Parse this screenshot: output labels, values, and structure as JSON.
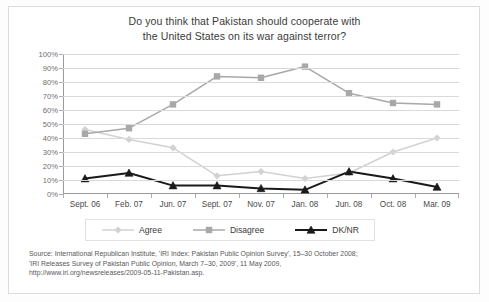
{
  "title": {
    "line1": "Do you think that Pakistan should cooperate with",
    "line2": "the United States on its war against terror?"
  },
  "source": {
    "line1": "Source: International Republican Institute, 'IRI Index: Pakistan Public Opinion Survey', 15–30 October 2008;",
    "line2": "'IRI Releases Survey of Pakistan Public Opinion, March 7–30, 2009', 11 May 2009,",
    "line3": "http://www.iri.org/newsreleases/2009-05-11-Pakistan.asp."
  },
  "legend": {
    "items": [
      {
        "label": "Agree",
        "color": "#d2d2d2",
        "marker": "diamond"
      },
      {
        "label": "Disagree",
        "color": "#a8a8a8",
        "marker": "square"
      },
      {
        "label": "DK/NR",
        "color": "#1a1a1a",
        "marker": "triangle"
      }
    ]
  },
  "chart_data": {
    "type": "line",
    "title": "Do you think that Pakistan should cooperate with the United States on its war against terror?",
    "xlabel": "",
    "ylabel": "",
    "ylim": [
      0,
      100
    ],
    "ytick_labels": [
      "0%",
      "10%",
      "20%",
      "30%",
      "40%",
      "50%",
      "60%",
      "70%",
      "80%",
      "90%",
      "100%"
    ],
    "ytick_values": [
      0,
      10,
      20,
      30,
      40,
      50,
      60,
      70,
      80,
      90,
      100
    ],
    "grid": true,
    "legend_position": "bottom",
    "categories": [
      "Sept. 06",
      "Feb. 07",
      "Jun. 07",
      "Sept. 07",
      "Nov. 07",
      "Jan. 08",
      "Jun. 08",
      "Oct. 08",
      "Mar. 09"
    ],
    "series": [
      {
        "name": "Agree",
        "color": "#d2d2d2",
        "marker": "diamond",
        "values": [
          46,
          39,
          33,
          13,
          16,
          11,
          15,
          30,
          40
        ]
      },
      {
        "name": "Disagree",
        "color": "#a8a8a8",
        "marker": "square",
        "values": [
          43,
          47,
          64,
          84,
          83,
          91,
          72,
          65,
          64
        ]
      },
      {
        "name": "DK/NR",
        "color": "#1a1a1a",
        "marker": "triangle",
        "values": [
          11,
          15,
          6,
          6,
          4,
          3,
          16,
          11,
          5
        ]
      }
    ]
  }
}
